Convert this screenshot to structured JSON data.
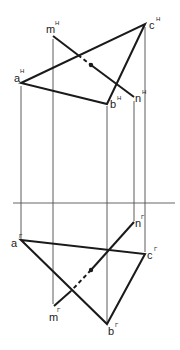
{
  "diagram": {
    "type": "orthographic-projection",
    "axis": {
      "y": 203,
      "x1": 13,
      "x2": 175
    },
    "colors": {
      "lines": "#1a1a1a",
      "projection_lines": "#333333",
      "background": "#ffffff"
    },
    "upper_view": {
      "superscript": "H",
      "points": {
        "a": {
          "label": "a",
          "x": 21,
          "y": 83
        },
        "b": {
          "label": "b",
          "x": 107,
          "y": 104
        },
        "c": {
          "label": "c",
          "x": 145,
          "y": 24
        },
        "m": {
          "label": "m",
          "x": 53,
          "y": 36
        },
        "n": {
          "label": "n",
          "x": 134,
          "y": 97
        }
      },
      "intersection_point": {
        "x": 91,
        "y": 65
      }
    },
    "lower_view": {
      "superscript": "Г",
      "points": {
        "a": {
          "label": "a",
          "x": 21,
          "y": 240
        },
        "b": {
          "label": "b",
          "x": 107,
          "y": 324
        },
        "c": {
          "label": "c",
          "x": 145,
          "y": 254
        },
        "m": {
          "label": "m",
          "x": 54,
          "y": 306
        },
        "n": {
          "label": "n",
          "x": 134,
          "y": 222
        }
      },
      "intersection_point": {
        "x": 91,
        "y": 270
      }
    },
    "labels": {
      "a_upper": "a",
      "a_upper_sup": "H",
      "b_upper": "b",
      "b_upper_sup": "H",
      "c_upper": "c",
      "c_upper_sup": "H",
      "m_upper": "m",
      "m_upper_sup": "H",
      "n_upper": "n",
      "n_upper_sup": "H",
      "a_lower": "a",
      "a_lower_sup": "Г",
      "b_lower": "b",
      "b_lower_sup": "Г",
      "c_lower": "c",
      "c_lower_sup": "Г",
      "m_lower": "m",
      "m_lower_sup": "Г",
      "n_lower": "n",
      "n_lower_sup": "Г"
    }
  }
}
